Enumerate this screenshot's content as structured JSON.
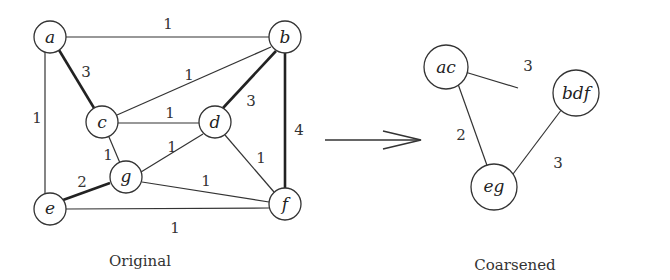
{
  "original": {
    "caption": "Original",
    "nodes": [
      {
        "id": "a",
        "label": "a",
        "x": 50,
        "y": 37
      },
      {
        "id": "b",
        "label": "b",
        "x": 285,
        "y": 37
      },
      {
        "id": "c",
        "label": "c",
        "x": 102,
        "y": 122
      },
      {
        "id": "d",
        "label": "d",
        "x": 215,
        "y": 122
      },
      {
        "id": "g",
        "label": "g",
        "x": 126,
        "y": 178
      },
      {
        "id": "e",
        "label": "e",
        "x": 50,
        "y": 209
      },
      {
        "id": "f",
        "label": "f",
        "x": 285,
        "y": 204
      }
    ],
    "edges": [
      {
        "from": "a",
        "to": "b",
        "weight": "1",
        "heavy": false
      },
      {
        "from": "a",
        "to": "c",
        "weight": "3",
        "heavy": true
      },
      {
        "from": "a",
        "to": "e",
        "weight": "1",
        "heavy": false
      },
      {
        "from": "b",
        "to": "c",
        "weight": "1",
        "heavy": false
      },
      {
        "from": "b",
        "to": "d",
        "weight": "3",
        "heavy": true
      },
      {
        "from": "b",
        "to": "f",
        "weight": "4",
        "heavy": true
      },
      {
        "from": "c",
        "to": "d",
        "weight": "1",
        "heavy": false
      },
      {
        "from": "c",
        "to": "g",
        "weight": "1",
        "heavy": false
      },
      {
        "from": "d",
        "to": "g",
        "weight": "1",
        "heavy": false
      },
      {
        "from": "d",
        "to": "f",
        "weight": "1",
        "heavy": false
      },
      {
        "from": "g",
        "to": "e",
        "weight": "2",
        "heavy": true
      },
      {
        "from": "g",
        "to": "f",
        "weight": "1",
        "heavy": false
      },
      {
        "from": "e",
        "to": "f",
        "weight": "1",
        "heavy": false
      }
    ]
  },
  "arrow": {
    "label": "coarsening arrow"
  },
  "coarsened": {
    "caption": "Coarsened",
    "nodes": [
      {
        "id": "ac",
        "label": "ac",
        "x": 447,
        "y": 67
      },
      {
        "id": "bdf",
        "label": "bdf",
        "x": 536,
        "y": 92
      },
      {
        "id": "eg",
        "label": "eg",
        "x": 494,
        "y": 187
      }
    ],
    "edges": [
      {
        "from": "ac",
        "to": "bdf",
        "weight": "3"
      },
      {
        "from": "ac",
        "to": "eg",
        "weight": "2"
      },
      {
        "from": "eg",
        "to": "bdf",
        "weight": "3"
      }
    ]
  }
}
